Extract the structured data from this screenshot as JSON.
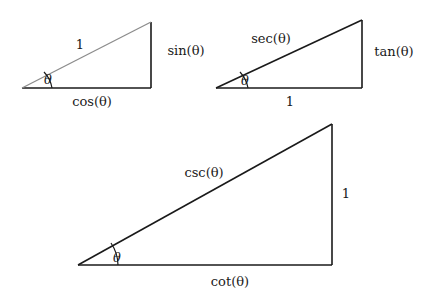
{
  "figure": {
    "background_color": "#ffffff",
    "stroke_color": "#1a1a1a",
    "light_stroke_color": "#8c8c8c"
  },
  "triangles": [
    {
      "id": "unit-hypotenuse-triangle",
      "name": "sine-cosine-triangle",
      "vertices": {
        "left": [
          22,
          88
        ],
        "right_bottom": [
          151,
          88
        ],
        "right_top": [
          151,
          22
        ]
      },
      "hypotenuse_label": "1",
      "vertical_label": "sin(θ)",
      "base_label": "cos(θ)",
      "angle_label": "θ",
      "hypotenuse_label_pos": [
        80,
        44
      ],
      "vertical_label_pos": [
        186,
        50
      ],
      "base_label_pos": [
        92,
        101
      ],
      "angle_label_pos": [
        48,
        79
      ],
      "hypotenuse_color": "#8c8c8c",
      "leg_color": "#1a1a1a"
    },
    {
      "id": "unit-base-triangle",
      "name": "secant-tangent-triangle",
      "vertices": {
        "left": [
          216,
          88
        ],
        "right_bottom": [
          362,
          88
        ],
        "right_top": [
          362,
          20
        ]
      },
      "hypotenuse_label": "sec(θ)",
      "vertical_label": "tan(θ)",
      "base_label": "1",
      "angle_label": "θ",
      "hypotenuse_label_pos": [
        271,
        38
      ],
      "vertical_label_pos": [
        394,
        51
      ],
      "base_label_pos": [
        290,
        101
      ],
      "angle_label_pos": [
        245,
        80
      ],
      "hypotenuse_color": "#1a1a1a",
      "leg_color": "#1a1a1a"
    },
    {
      "id": "unit-vertical-triangle",
      "name": "cosecant-cotangent-triangle",
      "vertices": {
        "left": [
          78,
          265
        ],
        "right_bottom": [
          332,
          265
        ],
        "right_top": [
          332,
          124
        ]
      },
      "hypotenuse_label": "csc(θ)",
      "vertical_label": "1",
      "base_label": "cot(θ)",
      "angle_label": "θ",
      "hypotenuse_label_pos": [
        204,
        172
      ],
      "vertical_label_pos": [
        346,
        193
      ],
      "base_label_pos": [
        230,
        281
      ],
      "angle_label_pos": [
        117,
        257
      ],
      "hypotenuse_color": "#1a1a1a",
      "leg_color": "#1a1a1a"
    }
  ]
}
